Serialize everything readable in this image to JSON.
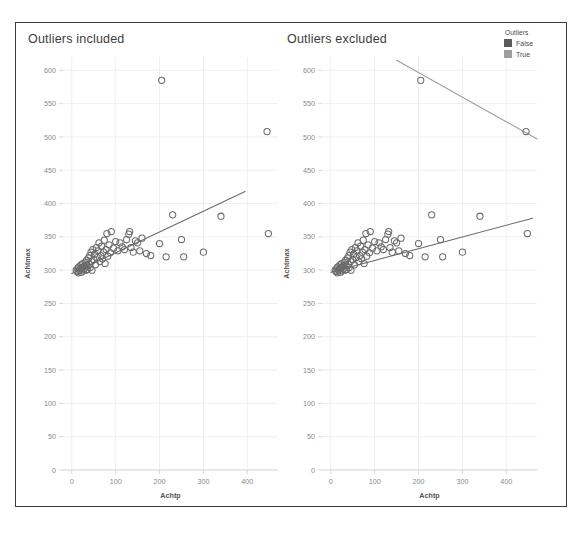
{
  "legend": {
    "title": "Outliers",
    "items": [
      {
        "label": "False",
        "color": "#5a5a5a"
      },
      {
        "label": "True",
        "color": "#9e9e9e"
      }
    ]
  },
  "chart_data": [
    {
      "type": "scatter",
      "title": "Outliers included",
      "xlabel": "Achtp",
      "ylabel": "Achtmax",
      "xlim": [
        -20,
        470
      ],
      "ylim": [
        0,
        620
      ],
      "xticks": [
        0,
        100,
        200,
        300,
        400
      ],
      "yticks": [
        0,
        50,
        100,
        150,
        200,
        250,
        300,
        350,
        400,
        450,
        500,
        550,
        600
      ],
      "grid": true,
      "legend_position": "top-right-outside",
      "marker": "open-circle",
      "point_color": "#6b6b6b",
      "series": [
        {
          "name": "Achtmax vs Achtp (all points)",
          "points": [
            [
              10,
              300
            ],
            [
              12,
              298
            ],
            [
              14,
              303
            ],
            [
              15,
              296
            ],
            [
              16,
              305
            ],
            [
              18,
              300
            ],
            [
              20,
              302
            ],
            [
              21,
              308
            ],
            [
              22,
              297
            ],
            [
              24,
              304
            ],
            [
              25,
              310
            ],
            [
              26,
              299
            ],
            [
              28,
              306
            ],
            [
              30,
              303
            ],
            [
              31,
              312
            ],
            [
              32,
              300
            ],
            [
              34,
              315
            ],
            [
              35,
              307
            ],
            [
              36,
              301
            ],
            [
              38,
              318
            ],
            [
              40,
              309
            ],
            [
              41,
              322
            ],
            [
              42,
              304
            ],
            [
              44,
              327
            ],
            [
              45,
              313
            ],
            [
              46,
              300
            ],
            [
              48,
              331
            ],
            [
              50,
              316
            ],
            [
              52,
              324
            ],
            [
              54,
              308
            ],
            [
              56,
              334
            ],
            [
              58,
              319
            ],
            [
              60,
              329
            ],
            [
              62,
              341
            ],
            [
              64,
              313
            ],
            [
              66,
              322
            ],
            [
              68,
              336
            ],
            [
              70,
              317
            ],
            [
              72,
              327
            ],
            [
              74,
              345
            ],
            [
              76,
              310
            ],
            [
              78,
              331
            ],
            [
              80,
              355
            ],
            [
              82,
              321
            ],
            [
              85,
              338
            ],
            [
              88,
              326
            ],
            [
              90,
              358
            ],
            [
              95,
              333
            ],
            [
              100,
              343
            ],
            [
              105,
              329
            ],
            [
              110,
              341
            ],
            [
              115,
              335
            ],
            [
              120,
              331
            ],
            [
              125,
              346
            ],
            [
              130,
              354
            ],
            [
              132,
              358
            ],
            [
              135,
              334
            ],
            [
              140,
              327
            ],
            [
              145,
              344
            ],
            [
              150,
              341
            ],
            [
              155,
              329
            ],
            [
              160,
              348
            ],
            [
              170,
              325
            ],
            [
              180,
              322
            ],
            [
              200,
              340
            ],
            [
              205,
              585
            ],
            [
              215,
              320
            ],
            [
              230,
              383
            ],
            [
              250,
              346
            ],
            [
              255,
              320
            ],
            [
              300,
              327
            ],
            [
              340,
              381
            ],
            [
              445,
              508
            ],
            [
              448,
              355
            ]
          ]
        }
      ],
      "trendlines": [
        {
          "name": "regression-all",
          "color": "#6b6b6b",
          "x0": 0,
          "y0": 295,
          "x1": 395,
          "y1": 418
        }
      ]
    },
    {
      "type": "scatter",
      "title": "Outliers excluded",
      "xlabel": "Achtp",
      "ylabel": "Achtmax",
      "xlim": [
        -20,
        470
      ],
      "ylim": [
        0,
        620
      ],
      "xticks": [
        0,
        100,
        200,
        300,
        400
      ],
      "yticks": [
        0,
        50,
        100,
        150,
        200,
        250,
        300,
        350,
        400,
        450,
        500,
        550,
        600
      ],
      "grid": true,
      "marker": "open-circle",
      "point_color": "#6b6b6b",
      "series": [
        {
          "name": "Achtmax vs Achtp (non-outliers)",
          "points": [
            [
              10,
              300
            ],
            [
              12,
              298
            ],
            [
              14,
              303
            ],
            [
              15,
              296
            ],
            [
              16,
              305
            ],
            [
              18,
              300
            ],
            [
              20,
              302
            ],
            [
              21,
              308
            ],
            [
              22,
              297
            ],
            [
              24,
              304
            ],
            [
              25,
              310
            ],
            [
              26,
              299
            ],
            [
              28,
              306
            ],
            [
              30,
              303
            ],
            [
              31,
              312
            ],
            [
              32,
              300
            ],
            [
              34,
              315
            ],
            [
              35,
              307
            ],
            [
              36,
              301
            ],
            [
              38,
              318
            ],
            [
              40,
              309
            ],
            [
              41,
              322
            ],
            [
              42,
              304
            ],
            [
              44,
              327
            ],
            [
              45,
              313
            ],
            [
              46,
              300
            ],
            [
              48,
              331
            ],
            [
              50,
              316
            ],
            [
              52,
              324
            ],
            [
              54,
              308
            ],
            [
              56,
              334
            ],
            [
              58,
              319
            ],
            [
              60,
              329
            ],
            [
              62,
              341
            ],
            [
              64,
              313
            ],
            [
              66,
              322
            ],
            [
              68,
              336
            ],
            [
              70,
              317
            ],
            [
              72,
              327
            ],
            [
              74,
              345
            ],
            [
              76,
              310
            ],
            [
              78,
              331
            ],
            [
              80,
              355
            ],
            [
              82,
              321
            ],
            [
              85,
              338
            ],
            [
              88,
              326
            ],
            [
              90,
              358
            ],
            [
              95,
              333
            ],
            [
              100,
              343
            ],
            [
              105,
              329
            ],
            [
              110,
              341
            ],
            [
              115,
              335
            ],
            [
              120,
              331
            ],
            [
              125,
              346
            ],
            [
              130,
              354
            ],
            [
              132,
              358
            ],
            [
              135,
              334
            ],
            [
              140,
              327
            ],
            [
              145,
              344
            ],
            [
              150,
              341
            ],
            [
              155,
              329
            ],
            [
              160,
              348
            ],
            [
              170,
              325
            ],
            [
              180,
              322
            ],
            [
              200,
              340
            ],
            [
              215,
              320
            ],
            [
              230,
              383
            ],
            [
              250,
              346
            ],
            [
              255,
              320
            ],
            [
              300,
              327
            ],
            [
              340,
              381
            ],
            [
              448,
              355
            ]
          ]
        },
        {
          "name": "outlier-points",
          "points": [
            [
              205,
              585
            ],
            [
              445,
              508
            ]
          ]
        }
      ],
      "trendlines": [
        {
          "name": "regression-non-outliers",
          "color": "#6b6b6b",
          "x0": 0,
          "y0": 297,
          "x1": 460,
          "y1": 378
        },
        {
          "name": "regression-outliers",
          "color": "#9e9e9e",
          "x0": 150,
          "y0": 615,
          "x1": 470,
          "y1": 497
        }
      ]
    }
  ]
}
